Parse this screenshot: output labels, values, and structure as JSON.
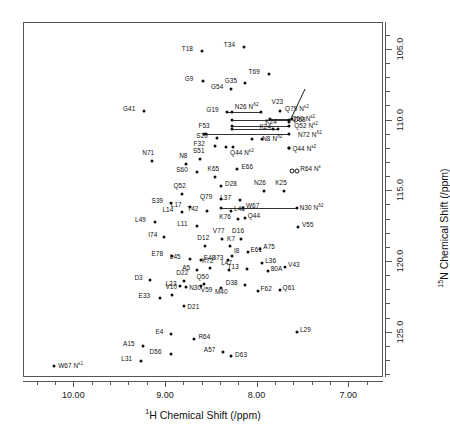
{
  "chart_data": {
    "type": "scatter",
    "title": "",
    "xlabel": "1H Chemical Shift (/ppm)",
    "ylabel": "15N Chemical Shift (/ppm)",
    "xlabel_prefix_sup": "1",
    "xlabel_rest": "H Chemical Shift (/ppm)",
    "ylabel_prefix_sup": "15",
    "ylabel_rest": "N Chemical Shift (/ppm)",
    "xlim": [
      10.55,
      6.62
    ],
    "ylim": [
      103.1,
      128.2
    ],
    "x_reversed": true,
    "y_reversed": true,
    "grid": false,
    "legend": "none",
    "xticks_major": [
      10.0,
      9.0,
      8.0,
      7.0
    ],
    "xticklabels": [
      "10.00",
      "9.00",
      "8.00",
      "7.00"
    ],
    "xticks_minor": [
      10.4,
      10.2,
      9.8,
      9.6,
      9.4,
      9.2,
      8.8,
      8.6,
      8.4,
      8.2,
      7.8,
      7.6,
      7.4,
      7.2,
      6.8
    ],
    "yticks_major": [
      105.0,
      110.0,
      115.0,
      120.0,
      125.0
    ],
    "yticklabels": [
      "105.0",
      "110.0",
      "115.0",
      "120.0",
      "125.0"
    ],
    "yticks_minor": [
      104.0,
      106.0,
      107.0,
      108.0,
      109.0,
      111.0,
      112.0,
      113.0,
      114.0,
      116.0,
      117.0,
      118.0,
      119.0,
      121.0,
      122.0,
      123.0,
      124.0,
      126.0,
      127.0,
      128.0
    ],
    "marker": "filled-circle",
    "points": [
      {
        "label": "T18",
        "x": 8.61,
        "y": 105.05,
        "lx": -20,
        "ly": -2
      },
      {
        "label": "T34",
        "x": 8.15,
        "y": 104.82,
        "lx": -20,
        "ly": -2
      },
      {
        "label": "T69",
        "x": 7.88,
        "y": 106.72,
        "lx": -20,
        "ly": -2
      },
      {
        "label": "G9",
        "x": 8.6,
        "y": 107.22,
        "lx": -18,
        "ly": -2
      },
      {
        "label": "G35",
        "x": 8.14,
        "y": 107.35,
        "lx": -20,
        "ly": -2
      },
      {
        "label": "G54",
        "x": 8.29,
        "y": 107.8,
        "lx": -20,
        "ly": -2
      },
      {
        "label": "G41",
        "x": 9.24,
        "y": 109.3,
        "lx": -21,
        "ly": -2
      },
      {
        "label": "G19",
        "x": 8.33,
        "y": 109.36,
        "lx": -21,
        "ly": -2
      },
      {
        "label": "V23",
        "x": 7.76,
        "y": 109.35,
        "lx": -8,
        "ly": -9
      },
      {
        "label": "D68",
        "x": 7.66,
        "y": 110.1,
        "lx": 5,
        "ly": -2,
        "leader": {
          "tx": 7.485,
          "ty": 107.72
        }
      },
      {
        "label": "S20",
        "x": 8.44,
        "y": 111.22,
        "lx": -21,
        "ly": -2
      },
      {
        "label": "F53",
        "x": 8.58,
        "y": 110.95,
        "lx": -6,
        "ly": -8
      },
      {
        "label": "K24",
        "x": 7.83,
        "y": 110.58,
        "lx": -8,
        "ly": -7
      },
      {
        "label": "F32",
        "x": 8.47,
        "y": 111.8,
        "lx": -21,
        "ly": -2
      },
      {
        "label": "N71",
        "x": 9.15,
        "y": 112.85,
        "lx": -10,
        "ly": -8
      },
      {
        "label": "N8",
        "x": 8.78,
        "y": 113.05,
        "lx": -7,
        "ly": -8
      },
      {
        "label": "S51",
        "x": 8.63,
        "y": 112.72,
        "lx": -7,
        "ly": -8
      },
      {
        "label": "S60",
        "x": 8.66,
        "y": 113.6,
        "lx": -21,
        "ly": -2
      },
      {
        "label": "K65",
        "x": 8.47,
        "y": 114.02,
        "lx": -7,
        "ly": -8
      },
      {
        "label": "E66",
        "x": 8.22,
        "y": 113.4,
        "lx": 4,
        "ly": -2
      },
      {
        "label": "D28",
        "x": 8.4,
        "y": 114.62,
        "lx": 4,
        "ly": -2
      },
      {
        "label": "N26",
        "x": 7.93,
        "y": 115.0,
        "lx": -10,
        "ly": -8
      },
      {
        "label": "K25",
        "x": 7.71,
        "y": 114.95,
        "lx": -9,
        "ly": -8
      },
      {
        "label": "Q52",
        "x": 8.83,
        "y": 115.18,
        "lx": -8,
        "ly": -8
      },
      {
        "label": "Q79",
        "x": 8.4,
        "y": 115.55,
        "lx": -21,
        "ly": -2
      },
      {
        "label": "L37",
        "x": 8.19,
        "y": 115.62,
        "lx": -20,
        "ly": -2
      },
      {
        "label": "S39",
        "x": 8.95,
        "y": 115.85,
        "lx": -19,
        "ly": -2
      },
      {
        "label": "L17",
        "x": 8.74,
        "y": 116.1,
        "lx": -19,
        "ly": -2
      },
      {
        "label": "T42",
        "x": 8.55,
        "y": 116.4,
        "lx": -20,
        "ly": -2
      },
      {
        "label": "L14",
        "x": 8.82,
        "y": 116.45,
        "lx": -20,
        "ly": -2
      },
      {
        "label": "L46",
        "x": 8.29,
        "y": 116.42,
        "lx": 3,
        "ly": -2
      },
      {
        "label": "W67",
        "x": 8.16,
        "y": 116.15,
        "lx": 3,
        "ly": -2
      },
      {
        "label": "K76",
        "x": 8.21,
        "y": 116.95,
        "lx": -19,
        "ly": -2
      },
      {
        "label": "Q44",
        "x": 8.14,
        "y": 116.88,
        "lx": 3,
        "ly": -2
      },
      {
        "label": "L49",
        "x": 9.12,
        "y": 117.15,
        "lx": -20,
        "ly": -2
      },
      {
        "label": "L11",
        "x": 8.66,
        "y": 117.45,
        "lx": -20,
        "ly": -2
      },
      {
        "label": "V55",
        "x": 7.56,
        "y": 117.55,
        "lx": 4,
        "ly": -2
      },
      {
        "label": "I74",
        "x": 9.02,
        "y": 118.25,
        "lx": -16,
        "ly": -2
      },
      {
        "label": "V77",
        "x": 8.39,
        "y": 118.4,
        "lx": -9,
        "ly": -8
      },
      {
        "label": "D16",
        "x": 8.18,
        "y": 118.38,
        "lx": -9,
        "ly": -8
      },
      {
        "label": "D12",
        "x": 8.57,
        "y": 118.85,
        "lx": -8,
        "ly": -8
      },
      {
        "label": "K7",
        "x": 8.3,
        "y": 118.9,
        "lx": -3,
        "ly": -7
      },
      {
        "label": "E61",
        "x": 8.11,
        "y": 119.28,
        "lx": 3,
        "ly": -2
      },
      {
        "label": "A75",
        "x": 7.97,
        "y": 119.08,
        "lx": 3,
        "ly": -2
      },
      {
        "label": "E78",
        "x": 8.93,
        "y": 119.55,
        "lx": -21,
        "ly": -2
      },
      {
        "label": "L45",
        "x": 8.74,
        "y": 119.82,
        "lx": -20,
        "ly": -2
      },
      {
        "label": "E48",
        "x": 8.62,
        "y": 119.88,
        "lx": 3,
        "ly": -2
      },
      {
        "label": "I73",
        "x": 8.32,
        "y": 119.85,
        "lx": -14,
        "ly": -2
      },
      {
        "label": "I8",
        "x": 8.28,
        "y": 119.6,
        "lx": 2,
        "ly": -5
      },
      {
        "label": "L36",
        "x": 7.95,
        "y": 120.05,
        "lx": 3,
        "ly": -2
      },
      {
        "label": "V43",
        "x": 7.7,
        "y": 120.35,
        "lx": 3,
        "ly": -2
      },
      {
        "label": "A5",
        "x": 8.66,
        "y": 120.55,
        "lx": -15,
        "ly": -2
      },
      {
        "label": "K72",
        "x": 8.52,
        "y": 120.45,
        "lx": -8,
        "ly": -7
      },
      {
        "label": "L47",
        "x": 8.31,
        "y": 120.58,
        "lx": -8,
        "ly": -7
      },
      {
        "label": "T13",
        "x": 8.12,
        "y": 120.52,
        "lx": -19,
        "ly": -2
      },
      {
        "label": "80A",
        "x": 7.89,
        "y": 120.6,
        "lx": 3,
        "ly": -2
      },
      {
        "label": "D3",
        "x": 9.17,
        "y": 121.25,
        "lx": -16,
        "ly": -2
      },
      {
        "label": "D22",
        "x": 8.8,
        "y": 121.35,
        "lx": -8,
        "ly": -8
      },
      {
        "label": "Q50",
        "x": 8.58,
        "y": 121.52,
        "lx": -8,
        "ly": -7
      },
      {
        "label": "L23",
        "x": 8.85,
        "y": 121.68,
        "lx": -14,
        "ly": -2
      },
      {
        "label": "N30",
        "x": 8.78,
        "y": 121.8,
        "lx": 3,
        "ly": 1
      },
      {
        "label": "V59",
        "x": 8.62,
        "y": 121.72,
        "lx": 0,
        "ly": 4
      },
      {
        "label": "M40",
        "x": 8.4,
        "y": 121.82,
        "lx": -6,
        "ly": 4
      },
      {
        "label": "D38",
        "x": 8.14,
        "y": 121.65,
        "lx": -19,
        "ly": -2
      },
      {
        "label": "F62",
        "x": 8.0,
        "y": 122.05,
        "lx": 3,
        "ly": -2
      },
      {
        "label": "Q61",
        "x": 7.76,
        "y": 122.0,
        "lx": 3,
        "ly": -2
      },
      {
        "label": "E33",
        "x": 9.07,
        "y": 122.52,
        "lx": -21,
        "ly": -2
      },
      {
        "label": "V10",
        "x": 8.93,
        "y": 122.3,
        "lx": -7,
        "ly": -8
      },
      {
        "label": "D21",
        "x": 8.8,
        "y": 123.1,
        "lx": 3,
        "ly": 1
      },
      {
        "label": "L29",
        "x": 7.57,
        "y": 124.92,
        "lx": 3,
        "ly": -2
      },
      {
        "label": "E4",
        "x": 8.94,
        "y": 125.08,
        "lx": -16,
        "ly": -2
      },
      {
        "label": "R64",
        "x": 8.69,
        "y": 125.42,
        "lx": 4,
        "ly": -2
      },
      {
        "label": "A15",
        "x": 9.25,
        "y": 125.95,
        "lx": -20,
        "ly": -2
      },
      {
        "label": "D56",
        "x": 8.95,
        "y": 126.5,
        "lx": -21,
        "ly": -2
      },
      {
        "label": "A57",
        "x": 8.38,
        "y": 126.38,
        "lx": -19,
        "ly": -2
      },
      {
        "label": "D63",
        "x": 8.29,
        "y": 126.62,
        "lx": 4,
        "ly": -1
      },
      {
        "label": "L31",
        "x": 9.27,
        "y": 126.98,
        "lx": -20,
        "ly": -2
      }
    ],
    "sidechain_points": [
      {
        "label": "W67 N",
        "sup": "ε1",
        "x": 10.22,
        "y": 127.38,
        "lx": 4,
        "ly": -1,
        "marker": "filled-circle"
      },
      {
        "label": "R64 N",
        "sup": "ε",
        "x": 7.6,
        "y": 113.52,
        "lx": 6,
        "ly": -2,
        "marker": "open-pair"
      }
    ],
    "sidechain_nh2_pairs": [
      {
        "label": "N26 N",
        "sup": "δ2",
        "x1": 8.28,
        "x2": 7.96,
        "y": 109.38,
        "lx": 8.25,
        "ly": 109.0,
        "link_from": 8.32,
        "link_to": 7.96
      },
      {
        "label": "Q79 N",
        "sup": "ε2",
        "x1": 7.86,
        "x2": 7.62,
        "y": 109.92,
        "lx": 7.7,
        "ly": 109.08,
        "link_from": 7.86,
        "link_to": 7.62
      },
      {
        "label": "Q50 N",
        "sup": "ε2",
        "x1": 8.28,
        "x2": 7.66,
        "y": 109.95,
        "lx": 7.63,
        "ly": 109.8,
        "link_from": 8.28,
        "link_to": 7.66
      },
      {
        "label": "Q52 N",
        "sup": "ε2",
        "x1": 8.28,
        "x2": 7.66,
        "y": 110.38,
        "lx": 7.6,
        "ly": 110.28,
        "link_from": 8.28,
        "link_to": 7.66
      },
      {
        "label": "K24",
        "sup": "",
        "x1": 8.28,
        "x2": 7.78,
        "y": 110.62,
        "lx": 7.98,
        "ly": 110.42,
        "link_from": 8.28,
        "link_to": 7.78
      },
      {
        "label": "N72 N",
        "sup": "δ2",
        "x1": 8.56,
        "x2": 7.66,
        "y": 110.95,
        "lx": 7.56,
        "ly": 110.92,
        "link_from": 8.6,
        "link_to": 7.66
      },
      {
        "label": "N8 N",
        "sup": "δ2",
        "x1": 8.06,
        "x2": 7.95,
        "y": 111.32,
        "lx": 7.95,
        "ly": 111.22,
        "link_from": null,
        "link_to": null
      },
      {
        "label": "Q44 N",
        "sup": "ε2",
        "x1": 8.34,
        "x2": 8.27,
        "y": 111.85,
        "lx": 8.3,
        "ly": 112.22,
        "link_from": null,
        "link_to": null
      },
      {
        "label": "Q44 N",
        "sup": "ε2",
        "x1": 7.66,
        "x2": 7.66,
        "y": 111.95,
        "lx": 7.62,
        "ly": 111.95,
        "link_from": null,
        "link_to": null
      },
      {
        "label": "N30 N",
        "sup": "δ2",
        "x1": 8.4,
        "x2": 7.57,
        "y": 116.18,
        "lx": 7.54,
        "ly": 116.12,
        "link_from": 8.4,
        "link_to": 7.57
      }
    ]
  }
}
